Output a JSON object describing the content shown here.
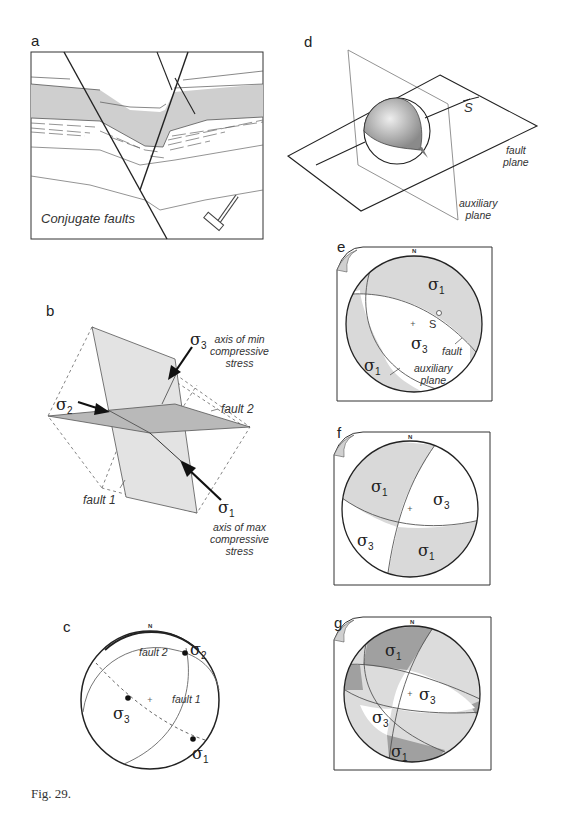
{
  "figure": {
    "caption": "Fig. 29.",
    "panels": {
      "a": {
        "letter": "a",
        "label": "Conjugate faults"
      },
      "b": {
        "letter": "b",
        "sigma_labels": {
          "s1": "σ",
          "s1_sub": "1",
          "s2": "σ",
          "s2_sub": "2",
          "s3": "σ",
          "s3_sub": "3"
        },
        "annotations": {
          "min_axis": [
            "axis of min",
            "compressive",
            "stress"
          ],
          "max_axis": [
            "axis of max",
            "compressive",
            "stress"
          ],
          "fault1": "fault 1",
          "fault2": "fault 2"
        }
      },
      "c": {
        "letter": "c",
        "north": "N",
        "fault1": "fault 1",
        "fault2": "fault 2",
        "sigma_labels": {
          "s1": "σ",
          "s1_sub": "1",
          "s2": "σ",
          "s2_sub": "2",
          "s3": "σ",
          "s3_sub": "3"
        }
      },
      "d": {
        "letter": "d",
        "slip_vector": "S",
        "fault_plane": [
          "fault",
          "plane"
        ],
        "auxiliary_plane": [
          "auxiliary",
          "plane"
        ]
      },
      "e": {
        "letter": "e",
        "north": "N",
        "slip": "S",
        "fault": "fault",
        "auxiliary_plane": [
          "auxiliary",
          "plane"
        ],
        "sigma_labels": {
          "s1a": "σ",
          "s1a_sub": "1",
          "s1b": "σ",
          "s1b_sub": "1",
          "s3": "σ",
          "s3_sub": "3"
        }
      },
      "f": {
        "letter": "f",
        "north": "N",
        "sigma_labels": {
          "s1a": "σ",
          "s1a_sub": "1",
          "s1b": "σ",
          "s1b_sub": "1",
          "s3a": "σ",
          "s3a_sub": "3",
          "s3b": "σ",
          "s3b_sub": "3"
        }
      },
      "g": {
        "letter": "g",
        "north": "N",
        "sigma_labels": {
          "s1a": "σ",
          "s1a_sub": "1",
          "s1b": "σ",
          "s1b_sub": "1",
          "s3a": "σ",
          "s3a_sub": "3",
          "s3b": "σ",
          "s3b_sub": "3"
        }
      }
    },
    "colors": {
      "line": "#222222",
      "light_gray": "#d9d9d9",
      "mid_gray": "#c4c4c4",
      "dark_gray": "#9a9a9a",
      "sphere": "#a8a8a8"
    }
  }
}
